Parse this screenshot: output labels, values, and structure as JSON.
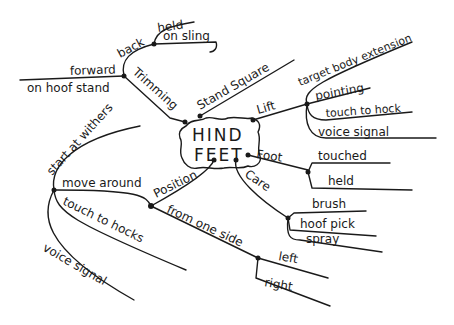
{
  "mindmap": {
    "center": {
      "line1": "HIND",
      "line2": "FEET"
    },
    "branches": {
      "trimming": {
        "label": "Trimming",
        "children": {
          "back": {
            "label": "back",
            "children": [
              "held",
              "on sling"
            ]
          },
          "forward": {
            "label": "forward",
            "children": [
              "on hoof stand"
            ]
          }
        }
      },
      "stand_square": {
        "label": "Stand Square"
      },
      "lift": {
        "label": "Lift",
        "children": [
          "target body extension",
          "pointing",
          "touch to hock",
          "voice signal"
        ]
      },
      "foot": {
        "label": "Foot",
        "children": [
          "touched",
          "held"
        ]
      },
      "care": {
        "label": "Care",
        "children": [
          "brush",
          "hoof pick",
          "spray"
        ]
      },
      "position": {
        "label": "Position",
        "children": {
          "move_around": {
            "label": "move around",
            "children": [
              "start at withers",
              "touch to hocks",
              "voice signal"
            ]
          },
          "from_one_side": {
            "label": "from one side",
            "children": [
              "left",
              "right"
            ]
          }
        }
      }
    }
  }
}
